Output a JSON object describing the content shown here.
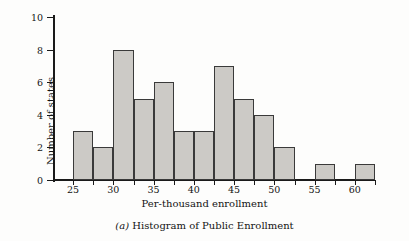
{
  "chart_data": {
    "type": "bar",
    "title": "",
    "caption_id": "(a)",
    "caption_text": "Histogram of Public Enrollment",
    "xlabel": "Per-thousand enrollment",
    "ylabel": "Number of states",
    "xlim": [
      22.5,
      62.5
    ],
    "ylim": [
      0,
      10
    ],
    "bin_width": 2.5,
    "grid": false,
    "legend": null,
    "bar_fill_color": "#cccac6",
    "bar_edge_color": "#3a3a3a",
    "axis_color": "#1a1a1a",
    "background_color": "#fdfdfc",
    "x_ticks": [
      25,
      30,
      35,
      40,
      45,
      50,
      55,
      60
    ],
    "x_tick_labels": [
      "25",
      "30",
      "35",
      "40",
      "45",
      "50",
      "55",
      "60"
    ],
    "y_ticks": [
      0,
      2,
      4,
      6,
      8,
      10
    ],
    "y_tick_labels": [
      "0",
      "2",
      "4",
      "6",
      "8",
      "10"
    ],
    "bins": [
      {
        "start": 25.0,
        "end": 27.5,
        "count": 3
      },
      {
        "start": 27.5,
        "end": 30.0,
        "count": 2
      },
      {
        "start": 30.0,
        "end": 32.5,
        "count": 8
      },
      {
        "start": 32.5,
        "end": 35.0,
        "count": 5
      },
      {
        "start": 35.0,
        "end": 37.5,
        "count": 6
      },
      {
        "start": 37.5,
        "end": 40.0,
        "count": 3
      },
      {
        "start": 40.0,
        "end": 42.5,
        "count": 3
      },
      {
        "start": 42.5,
        "end": 45.0,
        "count": 7
      },
      {
        "start": 45.0,
        "end": 47.5,
        "count": 5
      },
      {
        "start": 47.5,
        "end": 50.0,
        "count": 4
      },
      {
        "start": 50.0,
        "end": 52.5,
        "count": 2
      },
      {
        "start": 52.5,
        "end": 55.0,
        "count": 0
      },
      {
        "start": 55.0,
        "end": 57.5,
        "count": 1
      },
      {
        "start": 57.5,
        "end": 60.0,
        "count": 0
      },
      {
        "start": 60.0,
        "end": 62.5,
        "count": 1
      }
    ],
    "categories": [
      "25-27.5",
      "27.5-30",
      "30-32.5",
      "32.5-35",
      "35-37.5",
      "37.5-40",
      "40-42.5",
      "42.5-45",
      "45-47.5",
      "47.5-50",
      "50-52.5",
      "52.5-55",
      "55-57.5",
      "57.5-60",
      "60-62.5"
    ],
    "values": [
      3,
      2,
      8,
      5,
      6,
      3,
      3,
      7,
      5,
      4,
      2,
      0,
      1,
      0,
      1
    ]
  }
}
